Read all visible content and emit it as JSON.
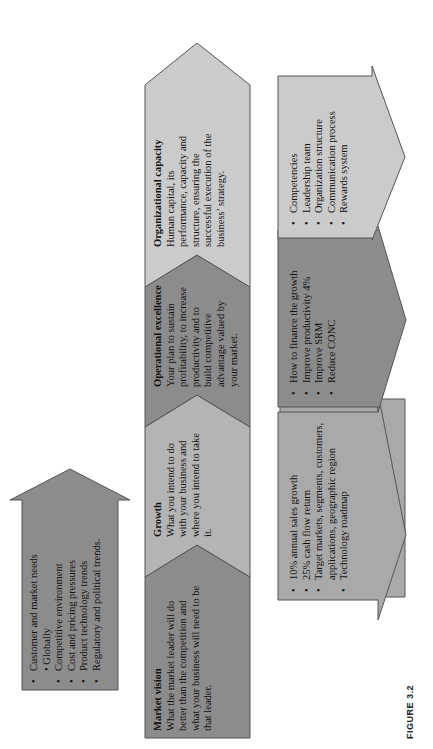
{
  "figure": {
    "label": "FIGURE 3.2"
  },
  "colors": {
    "dark": "#8c8c8c",
    "medium": "#a9a9a9",
    "light": "#cbcbcb",
    "outline": "#555555",
    "text": "#111111"
  },
  "market_needs": {
    "items": [
      "Customer and market needs",
      "• Globally",
      "Competitive environment",
      "Cost and pricing pressures",
      "Product technology trends",
      "Regulatory and political trends."
    ]
  },
  "strip": [
    {
      "title": "Market vision",
      "body": "What the market leader will do better than the competition and what your business will need to be that leader."
    },
    {
      "title": "Growth",
      "body": "What you intend to do with your business and where you intend to take it."
    },
    {
      "title": "Operational excellence",
      "body": "Your plan to sustain profitability, to increase productivity and to build competitive advantage valued by your market."
    },
    {
      "title": "Organizational capacity",
      "body": "Human capital, its performance, capacity and structure, ensuring the successful execution of the business’ strategy."
    }
  ],
  "actions": [
    {
      "items": [
        "10% annual sales growth",
        "25% cash flow return",
        "Target markets, segments, customers, applications, geographic region",
        "Technology roadmap"
      ]
    },
    {
      "items": [
        "How to finance the growth",
        "Improve productivity 4%",
        "Improve SRM",
        "Reduce CONC"
      ]
    },
    {
      "items": [
        "Competencies",
        "Leadership team",
        "Organization structure",
        "Communication process",
        "Rewards system"
      ]
    }
  ]
}
